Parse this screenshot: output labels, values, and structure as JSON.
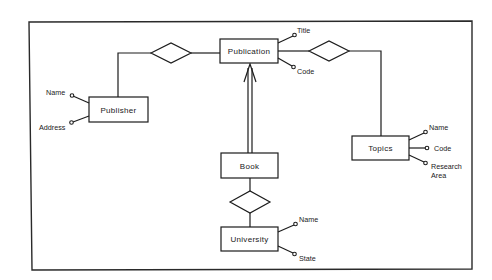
{
  "diagram": {
    "type": "entity-relationship",
    "entities": [
      {
        "id": "publisher",
        "label": "Publisher",
        "attributes": [
          "Name",
          "Address"
        ]
      },
      {
        "id": "publication",
        "label": "Publication",
        "attributes": [
          "Title",
          "Code"
        ]
      },
      {
        "id": "topics",
        "label": "Topics",
        "attributes": [
          "Name",
          "Code",
          "Research Area"
        ]
      },
      {
        "id": "book",
        "label": "Book",
        "attributes": []
      },
      {
        "id": "university",
        "label": "University",
        "attributes": [
          "Name",
          "State"
        ]
      }
    ],
    "relationships": [
      {
        "id": "rel-publisher-publication",
        "between": [
          "Publisher",
          "Publication"
        ],
        "label": ""
      },
      {
        "id": "rel-publication-topics",
        "between": [
          "Publication",
          "Topics"
        ],
        "label": ""
      },
      {
        "id": "rel-book-university",
        "between": [
          "Book",
          "University"
        ],
        "label": ""
      }
    ],
    "inheritance": [
      {
        "child": "Book",
        "parent": "Publication",
        "style": "double-line-arrow"
      }
    ]
  },
  "labels": {
    "publisher": "Publisher",
    "publication": "Publication",
    "topics": "Topics",
    "book": "Book",
    "university": "University",
    "publisher_name": "Name",
    "publisher_address": "Address",
    "publication_title": "Title",
    "publication_code": "Code",
    "topics_name": "Name",
    "topics_code": "Code",
    "topics_research_1": "Research",
    "topics_research_2": "Area",
    "university_name": "Name",
    "university_state": "State"
  }
}
